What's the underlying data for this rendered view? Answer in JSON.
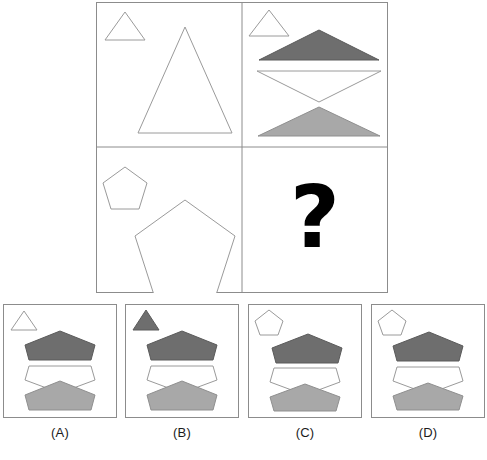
{
  "puzzle": {
    "type": "visual-analogy-matrix",
    "title_text": "",
    "matrix": {
      "rows": 2,
      "cols": 2,
      "border_color": "#8c8c8c",
      "cells": [
        {
          "id": "cell-1",
          "position": "top-left",
          "description": "small white triangle outline at upper left, large white triangle outline",
          "shapes": [
            {
              "name": "small-triangle-outline",
              "shape": "triangle",
              "fill": "#ffffff",
              "stroke": "#9a9a9a",
              "size": "small"
            },
            {
              "name": "large-triangle-outline",
              "shape": "triangle",
              "fill": "#ffffff",
              "stroke": "#9a9a9a",
              "size": "large"
            }
          ]
        },
        {
          "id": "cell-2",
          "position": "top-right",
          "description": "small white triangle outline at upper left, dark gray triangle, inverted white triangle, light gray triangle",
          "shapes": [
            {
              "name": "small-triangle-outline",
              "shape": "triangle",
              "fill": "#ffffff",
              "stroke": "#9a9a9a",
              "size": "small"
            },
            {
              "name": "dark-triangle",
              "shape": "triangle",
              "fill": "#6e6e6e",
              "stroke": "#5a5a5a",
              "size": "wide"
            },
            {
              "name": "inverted-white-triangle",
              "shape": "triangle-inverted",
              "fill": "#ffffff",
              "stroke": "#9a9a9a",
              "size": "wide"
            },
            {
              "name": "light-triangle",
              "shape": "triangle",
              "fill": "#a8a8a8",
              "stroke": "#8f8f8f",
              "size": "wide"
            }
          ]
        },
        {
          "id": "cell-3",
          "position": "bottom-left",
          "description": "small white pentagon outline at upper left, large white pentagon outline",
          "shapes": [
            {
              "name": "small-pentagon-outline",
              "shape": "pentagon",
              "fill": "#ffffff",
              "stroke": "#9a9a9a",
              "size": "small"
            },
            {
              "name": "large-pentagon-outline",
              "shape": "pentagon",
              "fill": "#ffffff",
              "stroke": "#9a9a9a",
              "size": "large"
            }
          ]
        },
        {
          "id": "cell-4",
          "position": "bottom-right",
          "description": "missing cell marked with a question mark",
          "question_mark": "?",
          "shapes": []
        }
      ]
    },
    "options": [
      {
        "id": "option-a",
        "label": "(A)",
        "corner_shape": {
          "name": "small-triangle-outline",
          "shape": "triangle",
          "fill": "#ffffff",
          "stroke": "#9a9a9a"
        },
        "shapes": [
          {
            "name": "dark-pentagon",
            "shape": "pentagon-flat",
            "fill": "#6e6e6e",
            "stroke": "#5a5a5a"
          },
          {
            "name": "white-pentagon-inverted",
            "shape": "pentagon-inverted",
            "fill": "#ffffff",
            "stroke": "#9a9a9a"
          },
          {
            "name": "light-pentagon",
            "shape": "pentagon-flat",
            "fill": "#a8a8a8",
            "stroke": "#8f8f8f"
          }
        ]
      },
      {
        "id": "option-b",
        "label": "(B)",
        "corner_shape": {
          "name": "small-triangle-filled",
          "shape": "triangle",
          "fill": "#6e6e6e",
          "stroke": "#5a5a5a"
        },
        "shapes": [
          {
            "name": "dark-pentagon",
            "shape": "pentagon-flat",
            "fill": "#6e6e6e",
            "stroke": "#5a5a5a"
          },
          {
            "name": "white-pentagon-inverted",
            "shape": "pentagon-inverted",
            "fill": "#ffffff",
            "stroke": "#9a9a9a"
          },
          {
            "name": "light-pentagon",
            "shape": "pentagon-flat",
            "fill": "#a8a8a8",
            "stroke": "#8f8f8f"
          }
        ]
      },
      {
        "id": "option-c",
        "label": "(C)",
        "corner_shape": {
          "name": "small-pentagon-outline",
          "shape": "pentagon",
          "fill": "#ffffff",
          "stroke": "#9a9a9a"
        },
        "shapes": [
          {
            "name": "dark-pentagon",
            "shape": "pentagon-flat",
            "fill": "#6e6e6e",
            "stroke": "#5a5a5a"
          },
          {
            "name": "white-pentagon-inverted",
            "shape": "pentagon-inverted",
            "fill": "#ffffff",
            "stroke": "#9a9a9a"
          },
          {
            "name": "light-pentagon",
            "shape": "pentagon-flat",
            "fill": "#a8a8a8",
            "stroke": "#8f8f8f"
          }
        ]
      },
      {
        "id": "option-d",
        "label": "(D)",
        "corner_shape": {
          "name": "small-pentagon-outline",
          "shape": "pentagon",
          "fill": "#ffffff",
          "stroke": "#9a9a9a"
        },
        "shapes": [
          {
            "name": "dark-pentagon",
            "shape": "pentagon-flat",
            "fill": "#6e6e6e",
            "stroke": "#5a5a5a"
          },
          {
            "name": "white-pentagon-inverted",
            "shape": "pentagon-inverted",
            "fill": "#ffffff",
            "stroke": "#9a9a9a"
          },
          {
            "name": "light-pentagon",
            "shape": "pentagon-flat",
            "fill": "#a8a8a8",
            "stroke": "#8f8f8f"
          }
        ]
      }
    ],
    "colors": {
      "dark_gray": "#6e6e6e",
      "light_gray": "#a8a8a8",
      "outline": "#9a9a9a",
      "frame": "#8c8c8c",
      "background": "#ffffff",
      "question_mark": "#000000"
    }
  }
}
